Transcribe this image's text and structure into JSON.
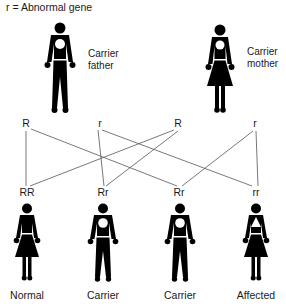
{
  "legend": "r = Abnormal gene",
  "parents": {
    "father": {
      "label_line1": "Carrier",
      "label_line2": "father",
      "sex": "male",
      "marker": "circle"
    },
    "mother": {
      "label_line1": "Carrier",
      "label_line2": "mother",
      "sex": "female",
      "marker": "circle"
    }
  },
  "alleles": [
    {
      "label": "R",
      "from": "father"
    },
    {
      "label": "r",
      "from": "father"
    },
    {
      "label": "R",
      "from": "mother"
    },
    {
      "label": "r",
      "from": "mother"
    }
  ],
  "offspring": [
    {
      "genotype": "RR",
      "status": "Normal",
      "sex": "female",
      "marker": "none"
    },
    {
      "genotype": "Rr",
      "status": "Carrier",
      "sex": "male",
      "marker": "circle"
    },
    {
      "genotype": "Rr",
      "status": "Carrier",
      "sex": "male",
      "marker": "circle"
    },
    {
      "genotype": "rr",
      "status": "Affected",
      "sex": "female",
      "marker": "triangle"
    }
  ],
  "connections": [
    {
      "allele": 0,
      "offspring": 0
    },
    {
      "allele": 0,
      "offspring": 2
    },
    {
      "allele": 1,
      "offspring": 1
    },
    {
      "allele": 1,
      "offspring": 3
    },
    {
      "allele": 2,
      "offspring": 0
    },
    {
      "allele": 2,
      "offspring": 1
    },
    {
      "allele": 3,
      "offspring": 2
    },
    {
      "allele": 3,
      "offspring": 3
    }
  ],
  "colors": {
    "figure": "#000000",
    "line": "#555555",
    "text": "#1a1a1a"
  }
}
